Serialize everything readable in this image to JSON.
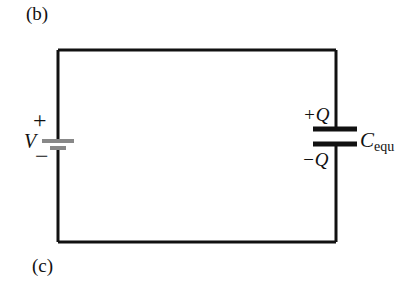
{
  "panels": {
    "top_label": "(b)",
    "bottom_label": "(c)"
  },
  "battery": {
    "symbol": "V",
    "plus": "+",
    "minus": "−",
    "plate_color": "#888888"
  },
  "capacitor": {
    "top_charge": "+Q",
    "bottom_charge": "−Q",
    "name_main": "C",
    "name_sub": "equ",
    "plate_color": "#111111"
  },
  "circuit": {
    "wire_color": "#111111"
  }
}
